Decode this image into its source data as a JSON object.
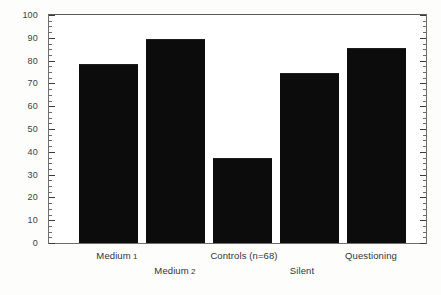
{
  "chart_data": {
    "type": "bar",
    "title": "",
    "xlabel": "",
    "ylabel": "",
    "ylim": [
      0,
      100
    ],
    "ytick_step": 10,
    "yminor_step": 2.5,
    "grid": false,
    "legend": null,
    "categories": [
      "Medium 1",
      "Medium 2",
      "Controls  (n=68)",
      "Silent",
      "Questioning"
    ],
    "values": [
      78,
      89,
      37,
      74,
      85
    ],
    "ytick_labels": [
      "0",
      "10",
      "20",
      "30",
      "40",
      "50",
      "60",
      "70",
      "80",
      "90",
      "100"
    ],
    "bar_color": "#0c0c0c",
    "axis_color": "#6e6e6e",
    "background_color": "#fdfdfc"
  },
  "axis": {
    "y_ticks": [
      {
        "value": 100,
        "label": "100"
      },
      {
        "value": 90,
        "label": "90"
      },
      {
        "value": 80,
        "label": "80"
      },
      {
        "value": 70,
        "label": "70"
      },
      {
        "value": 60,
        "label": "60"
      },
      {
        "value": 50,
        "label": "50"
      },
      {
        "value": 40,
        "label": "40"
      },
      {
        "value": 30,
        "label": "30"
      },
      {
        "value": 20,
        "label": "20"
      },
      {
        "value": 10,
        "label": "10"
      },
      {
        "value": 0,
        "label": "0"
      }
    ]
  },
  "x_labels": [
    {
      "text": "Medium",
      "numeral": "1",
      "center": 117,
      "row": 0
    },
    {
      "text": "Medium",
      "numeral": "2",
      "center": 175,
      "row": 1
    },
    {
      "text": "Controls  (n=68)",
      "numeral": "",
      "center": 244,
      "row": 0
    },
    {
      "text": "Silent",
      "numeral": "",
      "center": 302,
      "row": 1
    },
    {
      "text": "Questioning",
      "numeral": "",
      "center": 371,
      "row": 0
    }
  ],
  "bars": [
    {
      "label": "Medium 1",
      "value": 78,
      "left": 30,
      "width": 59
    },
    {
      "label": "Medium 2",
      "value": 89,
      "left": 97,
      "width": 59
    },
    {
      "label": "Controls  (n=68)",
      "value": 37,
      "left": 164,
      "width": 59
    },
    {
      "label": "Silent",
      "value": 74,
      "left": 231,
      "width": 59
    },
    {
      "label": "Questioning",
      "value": 85,
      "left": 298,
      "width": 59
    }
  ]
}
